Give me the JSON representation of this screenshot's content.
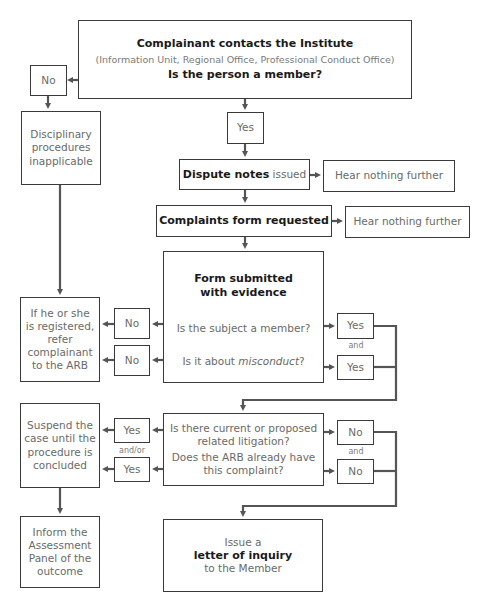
{
  "colors": {
    "line": "#555555",
    "border": "#3a3a3a",
    "text_bold": "#1a1a1a",
    "text_light": "#6a6a6a"
  },
  "nodes": {
    "start": {
      "title": "Complainant contacts the Institute",
      "subtitle": "(Information Unit, Regional Office, Professional Conduct Office)",
      "question": "Is the person a member?"
    },
    "no_member": "No",
    "yes_member": "Yes",
    "disciplinary": [
      "Disciplinary",
      "procedures",
      "inapplicable"
    ],
    "dispute": {
      "bold": "Dispute notes",
      "rest": " issued"
    },
    "hear1": "Hear nothing further",
    "complaints_form": "Complaints form requested",
    "hear2": "Hear nothing further",
    "form_submitted": {
      "title1": "Form submitted",
      "title2": "with evidence",
      "q1": "Is the subject a member?",
      "q2_pre": "Is it about ",
      "q2_em": "misconduct",
      "q2_post": "?"
    },
    "no_subject": "No",
    "no_misconduct": "No",
    "yes_subject": "Yes",
    "yes_misconduct": "Yes",
    "and1": "and",
    "refer": [
      "If he or she",
      "is registered,",
      "refer",
      "complainant",
      "to the ARB"
    ],
    "litigation": {
      "q1a": "Is there current or proposed",
      "q1b": "related litigation?",
      "q2a": "Does the ARB already have",
      "q2b": "this complaint?"
    },
    "yes_lit": "Yes",
    "yes_arb": "Yes",
    "andor": "and/or",
    "no_lit": "No",
    "no_arb": "No",
    "and2": "and",
    "suspend": [
      "Suspend the",
      "case until the",
      "procedure is",
      "concluded"
    ],
    "inform": [
      "Inform the",
      "Assessment",
      "Panel of the",
      "outcome"
    ],
    "issue": {
      "pre": "Issue a",
      "bold": "letter of inquiry",
      "post": "to the Member"
    }
  }
}
